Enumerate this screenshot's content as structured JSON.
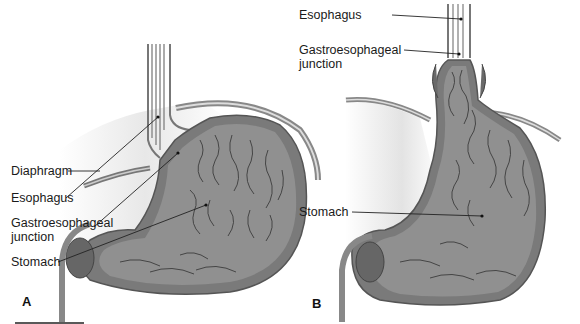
{
  "figure": {
    "panel_a": {
      "label": "A",
      "labels": {
        "diaphragm": "Diaphragm",
        "esophagus": "Esophagus",
        "ge_junction_line1": "Gastroesophageal",
        "ge_junction_line2": "junction",
        "stomach": "Stomach"
      }
    },
    "panel_b": {
      "label": "B",
      "labels": {
        "esophagus": "Esophagus",
        "ge_junction_line1": "Gastroesophageal",
        "ge_junction_line2": "junction",
        "stomach": "Stomach"
      }
    }
  },
  "colors": {
    "wall": "#6e6e6e",
    "lumen": "#8a8a8a",
    "background_shade": "#e4e4e4",
    "text": "#1a1a1a"
  }
}
